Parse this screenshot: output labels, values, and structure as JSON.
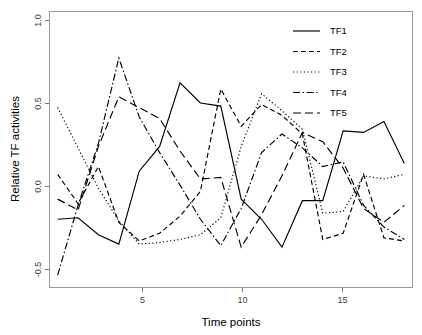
{
  "chart_data": {
    "type": "line",
    "title": "",
    "xlabel": "Time points",
    "ylabel": "Relative TF activities",
    "x": [
      1,
      2,
      3,
      4,
      5,
      6,
      7,
      8,
      9,
      10,
      11,
      12,
      13,
      14,
      15,
      16,
      17,
      18
    ],
    "xlim": [
      0.6,
      18.4
    ],
    "ylim": [
      -0.72,
      1.06
    ],
    "xticks": [
      5,
      10,
      15
    ],
    "xtick_labels": [
      "5",
      "10",
      "15"
    ],
    "yticks": [
      -0.5,
      0.0,
      0.5,
      1.0
    ],
    "ytick_labels": [
      "-0.5",
      "0.0",
      "0.5",
      "1.0"
    ],
    "grid": false,
    "legend_position": "top-right",
    "line_color": "#000000",
    "series": [
      {
        "name": "TF1",
        "dash": "solid",
        "dasharray": "none",
        "values": [
          -0.28,
          -0.27,
          -0.38,
          -0.44,
          0.03,
          0.19,
          0.6,
          0.47,
          0.45,
          -0.15,
          -0.28,
          -0.46,
          -0.16,
          -0.16,
          0.29,
          0.28,
          0.35,
          0.08
        ]
      },
      {
        "name": "TF2",
        "dash": "dashed-short",
        "dasharray": "5,3",
        "values": [
          0.01,
          -0.18,
          0.06,
          -0.3,
          -0.42,
          -0.37,
          -0.26,
          -0.1,
          0.56,
          0.32,
          0.46,
          0.39,
          0.27,
          -0.41,
          -0.37,
          0.01,
          -0.4,
          -0.42
        ]
      },
      {
        "name": "TF3",
        "dash": "dotted",
        "dasharray": "1.2,2.4",
        "values": [
          0.44,
          0.18,
          -0.08,
          -0.29,
          -0.44,
          -0.43,
          -0.41,
          -0.38,
          -0.27,
          0.19,
          0.53,
          0.42,
          0.3,
          -0.24,
          -0.23,
          0.0,
          -0.02,
          0.01
        ]
      },
      {
        "name": "TF4",
        "dash": "dash-dot",
        "dasharray": "7,2.5,1.5,2.5",
        "values": [
          -0.64,
          -0.19,
          0.21,
          0.76,
          0.38,
          0.15,
          -0.06,
          -0.28,
          -0.45,
          -0.21,
          0.15,
          0.27,
          0.18,
          0.06,
          0.09,
          -0.19,
          -0.33,
          -0.41
        ]
      },
      {
        "name": "TF5",
        "dash": "dashed-long",
        "dasharray": "8,4",
        "values": [
          -0.15,
          -0.22,
          0.19,
          0.51,
          0.44,
          0.37,
          0.16,
          -0.02,
          -0.01,
          -0.46,
          -0.25,
          0.0,
          0.28,
          0.22,
          0.05,
          -0.21,
          -0.3,
          -0.19
        ]
      }
    ]
  },
  "legend": {
    "entries": [
      {
        "label": "TF1"
      },
      {
        "label": "TF2"
      },
      {
        "label": "TF3"
      },
      {
        "label": "TF4"
      },
      {
        "label": "TF5"
      }
    ]
  }
}
